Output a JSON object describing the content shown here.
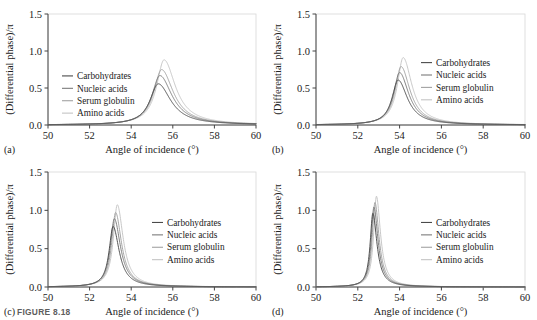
{
  "figure": {
    "caption_label": "FIGURE 8.18",
    "panel_labels": [
      "(a)",
      "(b)",
      "(c)",
      "(d)"
    ]
  },
  "axes": {
    "xlabel": "Angle of incidence (°)",
    "ylabel": "(Differential phase)/π",
    "xticks": [
      "50",
      "52",
      "54",
      "56",
      "58",
      "60"
    ],
    "yticks": [
      "0.0",
      "0.5",
      "1.0",
      "1.5"
    ],
    "xlim": [
      50,
      60
    ],
    "ylim": [
      0,
      1.5
    ]
  },
  "legend": {
    "entries": [
      {
        "label": "Carbohydrates",
        "color": "#4a4a4a"
      },
      {
        "label": "Nucleic acids",
        "color": "#7b7b7b"
      },
      {
        "label": "Serum globulin",
        "color": "#a2a2a2"
      },
      {
        "label": "Amino acids",
        "color": "#c4c4c4"
      }
    ]
  },
  "chart_data": [
    {
      "type": "line",
      "panel": "(a)",
      "title": "",
      "xlabel": "Angle of incidence (°)",
      "ylabel": "(Differential phase)/π",
      "xlim": [
        50,
        60
      ],
      "ylim": [
        0,
        1.5
      ],
      "legend_position": "inside-left",
      "grid": false,
      "series": [
        {
          "name": "Carbohydrates",
          "peak_x": 55.3,
          "peak_y": 0.55,
          "width": 0.62
        },
        {
          "name": "Nucleic acids",
          "peak_x": 55.38,
          "peak_y": 0.66,
          "width": 0.6
        },
        {
          "name": "Serum globulin",
          "peak_x": 55.46,
          "peak_y": 0.74,
          "width": 0.58
        },
        {
          "name": "Amino acids",
          "peak_x": 55.58,
          "peak_y": 0.87,
          "width": 0.56
        }
      ]
    },
    {
      "type": "line",
      "panel": "(b)",
      "title": "",
      "xlabel": "Angle of incidence (°)",
      "ylabel": "(Differential phase)/π",
      "xlim": [
        50,
        60
      ],
      "ylim": [
        0,
        1.5
      ],
      "legend_position": "inside-right",
      "grid": false,
      "series": [
        {
          "name": "Carbohydrates",
          "peak_x": 53.93,
          "peak_y": 0.6,
          "width": 0.46
        },
        {
          "name": "Nucleic acids",
          "peak_x": 54.0,
          "peak_y": 0.7,
          "width": 0.45
        },
        {
          "name": "Serum globulin",
          "peak_x": 54.07,
          "peak_y": 0.78,
          "width": 0.44
        },
        {
          "name": "Amino acids",
          "peak_x": 54.17,
          "peak_y": 0.9,
          "width": 0.43
        }
      ]
    },
    {
      "type": "line",
      "panel": "(c)",
      "title": "",
      "xlabel": "Angle of incidence (°)",
      "ylabel": "(Differential phase)/π",
      "xlim": [
        50,
        60
      ],
      "ylim": [
        0,
        1.5
      ],
      "legend_position": "inside-right",
      "grid": false,
      "series": [
        {
          "name": "Carbohydrates",
          "peak_x": 53.13,
          "peak_y": 0.78,
          "width": 0.3
        },
        {
          "name": "Nucleic acids",
          "peak_x": 53.19,
          "peak_y": 0.88,
          "width": 0.3
        },
        {
          "name": "Serum globulin",
          "peak_x": 53.25,
          "peak_y": 0.96,
          "width": 0.29
        },
        {
          "name": "Amino acids",
          "peak_x": 53.33,
          "peak_y": 1.06,
          "width": 0.29
        }
      ]
    },
    {
      "type": "line",
      "panel": "(d)",
      "title": "",
      "xlabel": "Angle of incidence (°)",
      "ylabel": "(Differential phase)/π",
      "xlim": [
        50,
        60
      ],
      "ylim": [
        0,
        1.5
      ],
      "legend_position": "inside-right",
      "grid": false,
      "series": [
        {
          "name": "Carbohydrates",
          "peak_x": 52.72,
          "peak_y": 0.95,
          "width": 0.2
        },
        {
          "name": "Nucleic acids",
          "peak_x": 52.77,
          "peak_y": 1.03,
          "width": 0.2
        },
        {
          "name": "Serum globulin",
          "peak_x": 52.82,
          "peak_y": 1.09,
          "width": 0.2
        },
        {
          "name": "Amino acids",
          "peak_x": 52.89,
          "peak_y": 1.17,
          "width": 0.2
        }
      ]
    }
  ]
}
